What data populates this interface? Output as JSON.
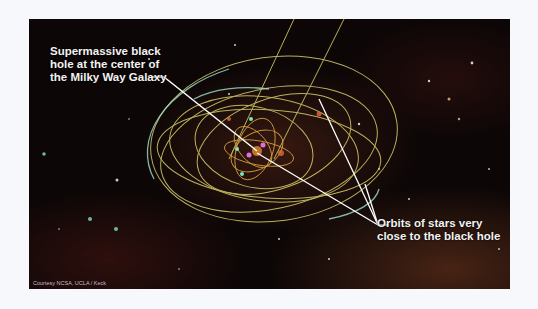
{
  "figure": {
    "callouts": [
      {
        "id": "black-hole",
        "lines": [
          "Supermassive black",
          "hole at the center of",
          "the Milky Way Galaxy"
        ]
      },
      {
        "id": "orbits",
        "lines": [
          "Orbits of stars very",
          "close to the black hole"
        ]
      }
    ],
    "credit": "Courtesy NCSA, UCLA / Keck",
    "colors": {
      "orbit": "#d8cf6a",
      "orbit_inner": "#e0a640",
      "highlight": "#9fe3d0",
      "callout_line": "#ffffff",
      "background": "#0c0606"
    }
  }
}
